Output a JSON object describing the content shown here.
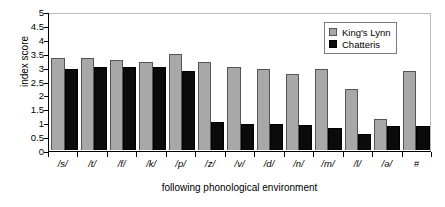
{
  "chart_data": {
    "type": "bar",
    "title": "",
    "subtitle": "",
    "xlabel": "following phonological environment",
    "ylabel": "index score",
    "ylim": [
      0,
      5
    ],
    "ytick_labels": [
      "5",
      "4.5",
      "4",
      "3.5",
      "3",
      "2.5",
      "2",
      "1.5",
      "1",
      "0.5",
      "0"
    ],
    "ytick_values": [
      5,
      4.5,
      4,
      3.5,
      3,
      2.5,
      2,
      1.5,
      1,
      0.5,
      0
    ],
    "grid": false,
    "legend_position": "top-right",
    "categories": [
      "/s/",
      "/t/",
      "/f/",
      "/k/",
      "/p/",
      "/z/",
      "/v/",
      "/d/",
      "/n/",
      "/m/",
      "/l/",
      "/ə/",
      "#"
    ],
    "series": [
      {
        "name": "King's Lynn",
        "color": "#a8a8a8",
        "values": [
          3.3,
          3.3,
          3.25,
          3.18,
          3.47,
          3.18,
          3.0,
          2.92,
          2.75,
          2.9,
          2.2,
          1.13,
          2.85
        ]
      },
      {
        "name": "Chatteris",
        "color": "#0b0b0b",
        "values": [
          2.9,
          3.0,
          3.0,
          3.0,
          2.85,
          1.0,
          0.95,
          0.95,
          0.9,
          0.8,
          0.58,
          0.88,
          0.88
        ]
      }
    ]
  }
}
